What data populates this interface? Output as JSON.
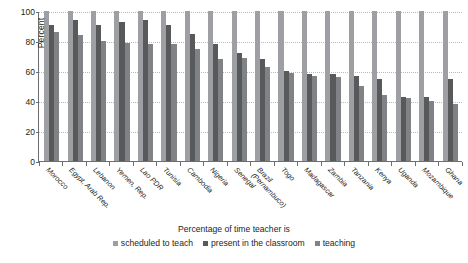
{
  "chart_data": {
    "type": "bar",
    "title": "",
    "xlabel": "",
    "ylabel": "Percent",
    "ylim": [
      0,
      100
    ],
    "yticks": [
      0,
      20,
      40,
      60,
      80,
      100
    ],
    "grid": true,
    "legend_position": "bottom",
    "caption": "Percentage of time teacher is",
    "categories": [
      "Morocco",
      "Egypt, Arab Rep.",
      "Lebanon",
      "Yemen, Rep.",
      "Lao PDR",
      "Tunisia",
      "Cambodia",
      "Nigeria",
      "Senegal",
      "Brazil (Pernambuco)",
      "Togo",
      "Madagascar",
      "Zambia",
      "Tanzania",
      "Kenya",
      "Uganda",
      "Mozambique",
      "Ghana"
    ],
    "category_lines": [
      [
        "Morocco"
      ],
      [
        "Egypt, Arab Rep."
      ],
      [
        "Lebanon"
      ],
      [
        "Yemen, Rep."
      ],
      [
        "Lao PDR"
      ],
      [
        "Tunisia"
      ],
      [
        "Cambodia"
      ],
      [
        "Nigeria"
      ],
      [
        "Senegal"
      ],
      [
        "Brazil",
        "(Pernambuco)"
      ],
      [
        "Togo"
      ],
      [
        "Madagascar"
      ],
      [
        "Zambia"
      ],
      [
        "Tanzania"
      ],
      [
        "Kenya"
      ],
      [
        "Uganda"
      ],
      [
        "Mozambique"
      ],
      [
        "Ghana"
      ]
    ],
    "series": [
      {
        "name": "scheduled to teach",
        "color": "#9d9fa2",
        "values": [
          100,
          100,
          100,
          100,
          100,
          100,
          100,
          100,
          100,
          100,
          100,
          100,
          100,
          100,
          100,
          100,
          100,
          100
        ]
      },
      {
        "name": "present in the classroom",
        "color": "#58595b",
        "values": [
          91,
          94,
          91,
          93,
          94,
          91,
          85,
          78,
          72,
          68,
          60,
          58,
          58,
          57,
          55,
          43,
          43,
          55
        ]
      },
      {
        "name": "teaching",
        "color": "#808285",
        "values": [
          86,
          84,
          80,
          79,
          78,
          78,
          75,
          68,
          69,
          63,
          59,
          57,
          56,
          50,
          44,
          42,
          40,
          38
        ]
      }
    ]
  },
  "legend": {
    "items": [
      {
        "label": "scheduled to teach"
      },
      {
        "label": "present in the classroom"
      },
      {
        "label": "teaching"
      }
    ]
  }
}
